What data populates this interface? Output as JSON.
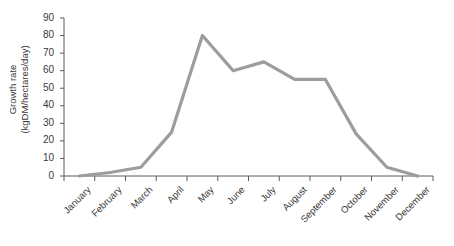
{
  "chart_data": {
    "type": "line",
    "title": "",
    "xlabel": "",
    "ylabel": "Growth rate (kgDM/hectares/day)",
    "ylabel_line1": "Growth rate",
    "ylabel_line2": "(kgDM/hectares/day)",
    "categories": [
      "January",
      "February",
      "March",
      "April",
      "May",
      "June",
      "July",
      "August",
      "September",
      "October",
      "November",
      "December"
    ],
    "values": [
      0,
      2,
      5,
      25,
      80,
      60,
      65,
      55,
      55,
      24,
      5,
      0
    ],
    "series": [
      {
        "name": "Growth rate",
        "values": [
          0,
          2,
          5,
          25,
          80,
          60,
          65,
          55,
          55,
          24,
          5,
          0
        ],
        "color": "#9d9d9d"
      }
    ],
    "ylim": [
      0,
      90
    ],
    "y_ticks": [
      0,
      10,
      20,
      30,
      40,
      50,
      60,
      70,
      80,
      90
    ],
    "y_tick_labels": [
      "0",
      "10",
      "20",
      "30",
      "40",
      "50",
      "60",
      "70",
      "80",
      "90"
    ],
    "grid": false,
    "legend": false,
    "legend_position": "none",
    "line_color": "#9d9d9d",
    "axis_color": "#5a5a5a",
    "background_color": "#ffffff",
    "x_tick_rotation": -45
  }
}
